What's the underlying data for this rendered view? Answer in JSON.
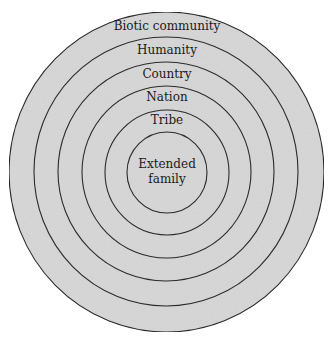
{
  "diagram": {
    "type": "concentric-circles",
    "colors": {
      "fill": "#d9d9d9",
      "stroke": "#2b2b2b",
      "text": "#1a1a1a",
      "background": "#ffffff"
    },
    "rings": [
      {
        "label": "Biotic community",
        "order": 1
      },
      {
        "label": "Humanity",
        "order": 2
      },
      {
        "label": "Country",
        "order": 3
      },
      {
        "label": "Nation",
        "order": 4
      },
      {
        "label": "Tribe",
        "order": 5
      }
    ],
    "center": {
      "label_line1": "Extended",
      "label_line2": "family"
    }
  }
}
